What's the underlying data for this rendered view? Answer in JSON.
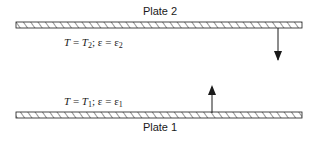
{
  "diagram": {
    "type": "parallel-plates-radiation",
    "colors": {
      "stroke": "#1a1a1a",
      "background": "#ffffff"
    },
    "plates": [
      {
        "id": "plate-2",
        "label": "Plate 2",
        "temperature_symbol": "T",
        "temperature_value": "T",
        "temperature_subscript": "2",
        "emissivity_symbol": "ε",
        "emissivity_value": "ε",
        "emissivity_subscript": "2",
        "arrow_direction": "down"
      },
      {
        "id": "plate-1",
        "label": "Plate 1",
        "temperature_symbol": "T",
        "temperature_value": "T",
        "temperature_subscript": "1",
        "emissivity_symbol": "ε",
        "emissivity_value": "ε",
        "emissivity_subscript": "1",
        "arrow_direction": "up"
      }
    ],
    "separators": {
      "equals": " = ",
      "semicolon": "; "
    }
  }
}
